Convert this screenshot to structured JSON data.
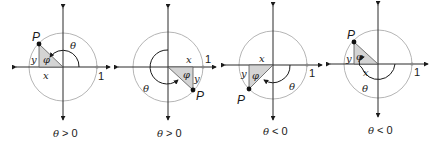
{
  "figure": {
    "colors": {
      "circle": "#b5b5b5",
      "axis": "#2a2a2a",
      "triangle_fill": "#d4d4d4",
      "point": "#111111"
    },
    "panels": [
      {
        "point_label": "P",
        "x_label": "x",
        "y_label": "y",
        "ref_angle_label": "φ",
        "angle_label": "θ",
        "unit_label": "1",
        "caption_theta": "θ",
        "caption_rel": ">",
        "caption_zero": "0"
      },
      {
        "point_label": "P",
        "x_label": "x",
        "y_label": "y",
        "ref_angle_label": "φ",
        "angle_label": "θ",
        "unit_label": "1",
        "caption_theta": "θ",
        "caption_rel": ">",
        "caption_zero": "0"
      },
      {
        "point_label": "P",
        "x_label": "x",
        "y_label": "y",
        "ref_angle_label": "φ",
        "angle_label": "θ",
        "unit_label": "1",
        "caption_theta": "θ",
        "caption_rel": "<",
        "caption_zero": "0"
      },
      {
        "point_label": "P",
        "x_label": "x",
        "y_label": "y",
        "ref_angle_label": "φ",
        "angle_label": "θ",
        "unit_label": "1",
        "caption_theta": "θ",
        "caption_rel": "<",
        "caption_zero": "0"
      }
    ]
  }
}
